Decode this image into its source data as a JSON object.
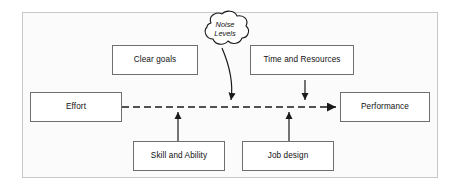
{
  "diagram": {
    "frame": {
      "border_color": "#c8c8c8",
      "fill": "#fbfbfb"
    },
    "nodes": {
      "effort": {
        "label": "Effort"
      },
      "clear_goals": {
        "label": "Clear goals"
      },
      "time_and_resources": {
        "label": "Time and Resources"
      },
      "performance": {
        "label": "Performance"
      },
      "skill_and_ability": {
        "label": "Skill and Ability"
      },
      "job_design": {
        "label": "Job design"
      }
    },
    "cloud": {
      "line1": "Noise",
      "line2": "Levels"
    },
    "edges": [
      {
        "name": "effort-to-performance",
        "style": "dashed",
        "from": "effort",
        "to": "performance"
      },
      {
        "name": "noise-levels-to-main-path",
        "style": "solid-curved",
        "from": "cloud",
        "to": "effort-to-performance"
      },
      {
        "name": "time-and-resources-to-main-path",
        "style": "solid",
        "from": "time_and_resources",
        "to": "effort-to-performance"
      },
      {
        "name": "skill-and-ability-to-main-path",
        "style": "solid",
        "from": "skill_and_ability",
        "to": "effort-to-performance"
      },
      {
        "name": "job-design-to-main-path",
        "style": "solid",
        "from": "job_design",
        "to": "effort-to-performance"
      }
    ],
    "colors": {
      "stroke": "#1a1a1a",
      "node_border": "#6f6f6f",
      "node_fill": "#ffffff",
      "text": "#111111"
    }
  }
}
